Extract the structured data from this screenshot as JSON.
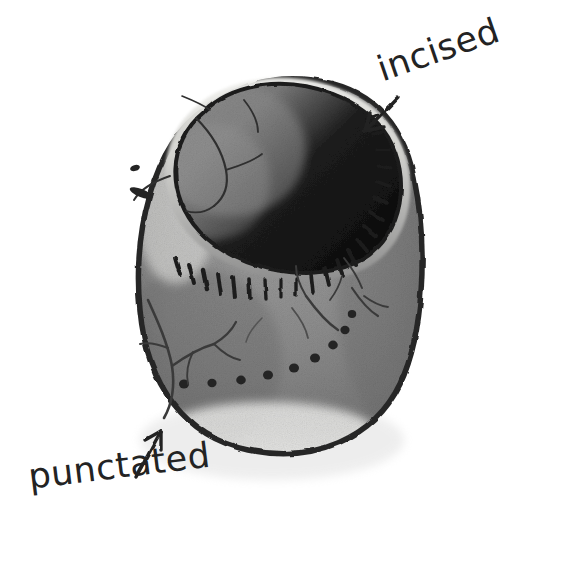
{
  "figure": {
    "kind": "annotated-photograph",
    "background_color": "#ffffff"
  },
  "annotations": [
    {
      "id": "incised",
      "label": "incised",
      "arrow": "arrow-left-down",
      "points_to": "rim tick marks",
      "color": "#232323"
    },
    {
      "id": "punctated",
      "label": "punctated",
      "arrow": "arrow-up-right",
      "points_to": "row of round dots on lower body",
      "color": "#232323"
    }
  ],
  "vessel": {
    "outline_color": "#2a2a2a",
    "body_color": "#8d8d8d",
    "body_shadow_color": "#6f6f6f",
    "highlight_color": "#e8e8e6",
    "interior_shadow_color": "#121212",
    "interior_lit_color": "#7c7c7c",
    "rim_band_color": "#9a9a9a",
    "incision_color": "#1f1f1f",
    "punctate_color": "#242424",
    "crack_color": "#3a3a3a",
    "incised_tick_count": 22,
    "punctate_dot_count": 9
  }
}
